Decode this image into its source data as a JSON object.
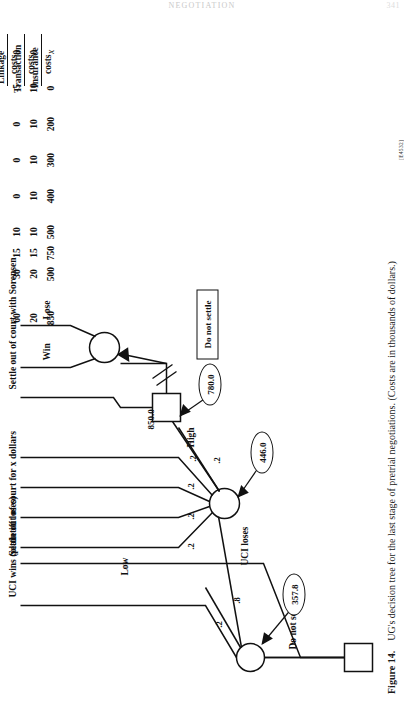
{
  "page": {
    "running_head": "NEGOTIATION",
    "folio": "341"
  },
  "caption": {
    "figure_number": "Figure 14.",
    "text": "UG's decision tree for the last stage of pretrial negotiations.  (Costs are in thousands of dollars.)",
    "code": "[E4532]"
  },
  "columns": [
    {
      "id": "insurance",
      "line1": "Insurance",
      "line2": "costs"
    },
    {
      "id": "transaction",
      "line1": "Transaction",
      "line2": "costs"
    },
    {
      "id": "linkage",
      "line1": "Linkage",
      "line2": "costs"
    }
  ],
  "outcomes": [
    {
      "label": "Settle out of court for x dollars",
      "insurance": "x",
      "transaction": "0",
      "linkage": "0"
    },
    {
      "label": "UCI wins (plaintiff loses)",
      "insurance": "0",
      "transaction": "10",
      "linkage": "-5"
    },
    {
      "label": "Low",
      "insurance": "200",
      "transaction": "10",
      "linkage": "0"
    },
    {
      "label": "",
      "insurance": "300",
      "transaction": "10",
      "linkage": "0"
    },
    {
      "label": "",
      "insurance": "400",
      "transaction": "10",
      "linkage": "0"
    },
    {
      "label": "",
      "insurance": "500",
      "transaction": "10",
      "linkage": "10"
    },
    {
      "label": "Settle out of court with Sorensen",
      "insurance": "750",
      "transaction": "15",
      "linkage": "15"
    },
    {
      "label": "Win",
      "insurance": "500",
      "transaction": "20",
      "linkage": "30"
    },
    {
      "label": "Lose",
      "insurance": "850",
      "transaction": "20",
      "linkage": "60"
    }
  ],
  "tree": {
    "root_decision_label_settle": "Settle out of court for x dollars",
    "root_decision_label_donot": "Do not settle",
    "root_value": "357.8",
    "root_branch_probabilities": [
      ".2",
      ".8"
    ],
    "chance1_label_win": "UCI wins (plaintiff loses)",
    "chance1_label_lose": "UCI loses",
    "chance2_value": "446.0",
    "chance2_probabilities": [
      ".2",
      ".2",
      ".2",
      ".2",
      ".2"
    ],
    "chance2_label_low": "Low",
    "chance2_label_high": "High",
    "decision2_value": "780.0",
    "decision2_high_value": "850.0",
    "decision2_label_donot": "Do not settle",
    "decision2_label_settle_sorensen": "Settle out of court with Sorensen",
    "chance3_label_win": "Win",
    "chance3_label_lose": "Lose"
  }
}
